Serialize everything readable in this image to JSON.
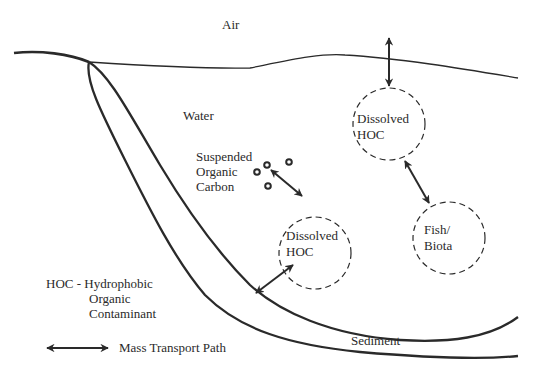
{
  "diagram": {
    "type": "environmental-fate-schematic",
    "colors": {
      "line": "#2a2a2a",
      "background": "#ffffff"
    },
    "compartments": {
      "air": "Air",
      "water": "Water",
      "sediment": "Sediment"
    },
    "nodes": {
      "dissolved_top": {
        "line1": "Dissolved",
        "line2": "HOC"
      },
      "dissolved_mid": {
        "line1": "Dissolved",
        "line2": "HOC"
      },
      "fish": {
        "line1": "Fish/",
        "line2": "Biota"
      },
      "suspended": {
        "line1": "Suspended",
        "line2": "Organic",
        "line3": "Carbon"
      }
    },
    "legend": {
      "hoc_line1": "HOC - Hydrophobic",
      "hoc_line2": "Organic",
      "hoc_line3": "Contaminant",
      "arrow_label": "Mass Transport Path"
    },
    "edges": [
      {
        "from": "air",
        "to": "dissolved_top"
      },
      {
        "from": "dissolved_top",
        "to": "fish"
      },
      {
        "from": "suspended",
        "to": "dissolved_mid"
      },
      {
        "from": "dissolved_mid",
        "to": "sediment"
      }
    ]
  }
}
